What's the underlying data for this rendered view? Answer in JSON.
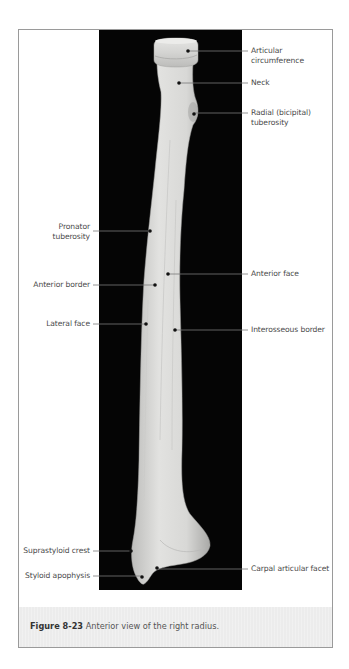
{
  "figure": {
    "number": "Figure 8-23",
    "caption_text": " Anterior view of the right radius.",
    "view": "Anterior view",
    "subject": "Right radius"
  },
  "labels": {
    "right": [
      {
        "id": "articular-circumference",
        "line1": "Articular",
        "line2": "circumference",
        "dot": [
          188,
          51
        ],
        "line_y": 51
      },
      {
        "id": "neck",
        "line1": "Neck",
        "line2": "",
        "dot": [
          179,
          83
        ],
        "line_y": 83
      },
      {
        "id": "radial-tuberosity",
        "line1": "Radial (bicipital)",
        "line2": "tuberosity",
        "dot": [
          194,
          114
        ],
        "line_y": 113
      },
      {
        "id": "anterior-face",
        "line1": "Anterior face",
        "line2": "",
        "dot": [
          168,
          274
        ],
        "line_y": 274
      },
      {
        "id": "interosseous-border",
        "line1": "Interosseous border",
        "line2": "",
        "dot": [
          175,
          330
        ],
        "line_y": 330
      },
      {
        "id": "carpal-articular-facet",
        "line1": "Carpal articular facet",
        "line2": "",
        "dot": [
          157,
          568
        ],
        "line_y": 569
      }
    ],
    "left": [
      {
        "id": "pronator-tuberosity",
        "line1": "Pronator",
        "line2": "tuberosity",
        "dot": [
          150,
          231
        ],
        "line_y": 231
      },
      {
        "id": "anterior-border",
        "line1": "Anterior border",
        "line2": "",
        "dot": [
          155,
          285
        ],
        "line_y": 285
      },
      {
        "id": "lateral-face",
        "line1": "Lateral face",
        "line2": "",
        "dot": [
          146,
          324
        ],
        "line_y": 324
      },
      {
        "id": "suprastyloid-crest",
        "line1": "Suprastyloid crest",
        "line2": "",
        "dot": [
          131,
          551
        ],
        "line_y": 551
      },
      {
        "id": "styloid-apophysis",
        "line1": "Styloid apophysis",
        "line2": "",
        "dot": [
          142,
          577
        ],
        "line_y": 576
      }
    ]
  },
  "colors": {
    "photo_background": "#050505",
    "bone_fill": "#d6d6d4",
    "leader_line": "#6a6a6a",
    "label_text": "#4a4a4a",
    "caption_band": "#ececec"
  }
}
